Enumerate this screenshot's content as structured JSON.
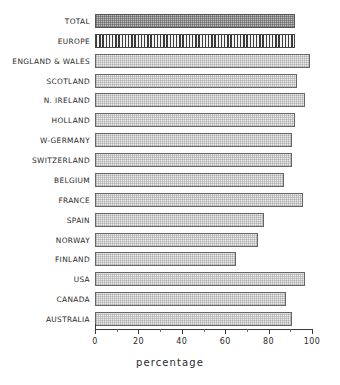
{
  "chart_data": {
    "type": "bar",
    "orientation": "horizontal",
    "title": "",
    "subtitle": "",
    "xlabel": "percentage",
    "ylabel": "",
    "xlim": [
      0,
      100
    ],
    "grid": false,
    "legend": "none",
    "xticks": [
      0,
      20,
      40,
      60,
      80,
      100
    ],
    "xtick_labels": [
      "0",
      "20",
      "40",
      "60",
      "80",
      "100"
    ],
    "minor_ticks": [
      10,
      30,
      50,
      70,
      90
    ],
    "categories": [
      "TOTAL",
      "EUROPE",
      "ENGLAND & WALES",
      "SCOTLAND",
      "N. IRELAND",
      "HOLLAND",
      "W-GERMANY",
      "SWITZERLAND",
      "BELGIUM",
      "FRANCE",
      "SPAIN",
      "NORWAY",
      "FINLAND",
      "USA",
      "CANADA",
      "AUSTRALIA"
    ],
    "values": [
      92,
      92,
      99,
      93,
      97,
      92,
      91,
      91,
      87,
      96,
      78,
      75,
      65,
      97,
      88,
      91
    ],
    "bars": [
      {
        "label": "TOTAL",
        "value": 92,
        "style": "fill-dense"
      },
      {
        "label": "EUROPE",
        "value": 92,
        "style": "fill-vstripe"
      },
      {
        "label": "ENGLAND & WALES",
        "value": 99,
        "style": "fill-light"
      },
      {
        "label": "SCOTLAND",
        "value": 93,
        "style": "fill-light"
      },
      {
        "label": "N. IRELAND",
        "value": 97,
        "style": "fill-light"
      },
      {
        "label": "HOLLAND",
        "value": 92,
        "style": "fill-light"
      },
      {
        "label": "W-GERMANY",
        "value": 91,
        "style": "fill-light"
      },
      {
        "label": "SWITZERLAND",
        "value": 91,
        "style": "fill-light"
      },
      {
        "label": "BELGIUM",
        "value": 87,
        "style": "fill-light"
      },
      {
        "label": "FRANCE",
        "value": 96,
        "style": "fill-light"
      },
      {
        "label": "SPAIN",
        "value": 78,
        "style": "fill-light"
      },
      {
        "label": "NORWAY",
        "value": 75,
        "style": "fill-light"
      },
      {
        "label": "FINLAND",
        "value": 65,
        "style": "fill-light"
      },
      {
        "label": "USA",
        "value": 97,
        "style": "fill-light"
      },
      {
        "label": "CANADA",
        "value": 88,
        "style": "fill-light"
      },
      {
        "label": "AUSTRALIA",
        "value": 91,
        "style": "fill-light"
      }
    ],
    "colors": {
      "bar_light_fill": "#ececec",
      "bar_dense_fill": "#bdbdbd",
      "bar_stripe_dark": "#3a3a3a",
      "bar_border": "#666666",
      "axis": "#3a3a3a",
      "text": "#2b2b2b",
      "background": "#ffffff"
    }
  }
}
